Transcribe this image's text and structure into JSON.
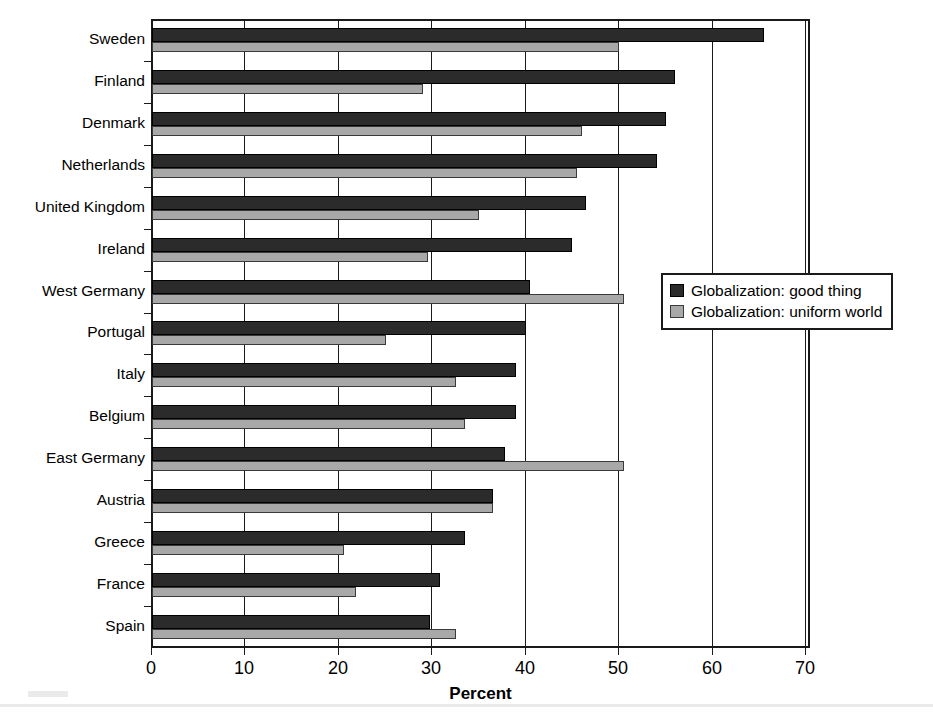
{
  "chart_data": {
    "type": "bar",
    "orientation": "horizontal",
    "title": "",
    "xlabel": "Percent",
    "ylabel": "",
    "xlim": [
      0,
      70
    ],
    "xticks": [
      0,
      10,
      20,
      30,
      40,
      50,
      60,
      70
    ],
    "grid": true,
    "legend_position": "right-middle",
    "categories": [
      "Sweden",
      "Finland",
      "Denmark",
      "Netherlands",
      "United Kingdom",
      "Ireland",
      "West Germany",
      "Portugal",
      "Italy",
      "Belgium",
      "East Germany",
      "Austria",
      "Greece",
      "France",
      "Spain"
    ],
    "series": [
      {
        "name": "Globalization: good thing",
        "color": "#2b2b2b",
        "values": [
          65.5,
          56.0,
          55.0,
          54.0,
          46.5,
          45.0,
          40.5,
          40.0,
          39.0,
          39.0,
          37.8,
          36.5,
          33.5,
          30.8,
          29.8
        ]
      },
      {
        "name": "Globalization: uniform world",
        "color": "#a8a8a8",
        "values": [
          50.0,
          29.0,
          46.0,
          45.5,
          35.0,
          29.5,
          50.5,
          25.0,
          32.5,
          33.5,
          50.5,
          36.5,
          20.5,
          21.8,
          32.5
        ]
      }
    ]
  }
}
